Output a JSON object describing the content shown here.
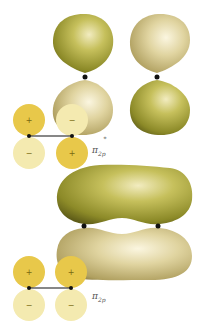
{
  "colors": {
    "lobe_green": "#9a9a2e",
    "lobe_tan": "#d8cc94",
    "ao_plus": "#e8c84a",
    "ao_minus": "#f4eab0",
    "bond_line": "#111111",
    "label": "#555555"
  },
  "antibonding": {
    "label_main": "π",
    "label_sub": "2p",
    "label_sup": "*",
    "atomic_orbitals": [
      {
        "position": "top-left",
        "sign": "+",
        "phase": "plus"
      },
      {
        "position": "bottom-left",
        "sign": "−",
        "phase": "minus"
      },
      {
        "position": "top-right",
        "sign": "−",
        "phase": "minus"
      },
      {
        "position": "bottom-right",
        "sign": "+",
        "phase": "plus"
      }
    ]
  },
  "bonding": {
    "label_main": "π",
    "label_sub": "2p",
    "atomic_orbitals": [
      {
        "position": "top-left",
        "sign": "+",
        "phase": "plus"
      },
      {
        "position": "bottom-left",
        "sign": "−",
        "phase": "minus"
      },
      {
        "position": "top-right",
        "sign": "+",
        "phase": "plus"
      },
      {
        "position": "bottom-right",
        "sign": "−",
        "phase": "minus"
      }
    ]
  }
}
